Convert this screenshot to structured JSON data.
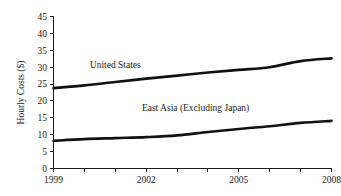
{
  "chart_data": {
    "type": "line",
    "title": "",
    "xlabel": "",
    "ylabel": "Hourly Costs ($)",
    "xlim": [
      1999,
      2008
    ],
    "ylim": [
      0,
      45
    ],
    "grid": false,
    "legend_position": "inline-annotation",
    "x": [
      1999,
      2000,
      2001,
      2002,
      2003,
      2004,
      2005,
      2006,
      2007,
      2008
    ],
    "y_ticks": [
      0,
      5,
      10,
      15,
      20,
      25,
      30,
      35,
      40,
      45
    ],
    "y_tick_labels": [
      "0",
      "5",
      "10",
      "15",
      "20",
      "25",
      "30",
      "35",
      "40",
      "45"
    ],
    "x_ticks": [
      1999,
      2000,
      2001,
      2002,
      2003,
      2004,
      2005,
      2006,
      2007,
      2008
    ],
    "x_tick_labels_shown": [
      "1999",
      "2002",
      "2005",
      "2008"
    ],
    "x_labeled_ticks": [
      1999,
      2002,
      2005,
      2008
    ],
    "series": [
      {
        "name": "United States",
        "label": "United States",
        "color": "#111111",
        "values": [
          23.8,
          24.6,
          25.6,
          26.6,
          27.5,
          28.4,
          29.2,
          30.0,
          31.8,
          32.6
        ],
        "label_x": 2001.0,
        "label_y": 29.9
      },
      {
        "name": "East Asia (Excluding Japan)",
        "label": "East Asia (Excluding Japan)",
        "color": "#111111",
        "values": [
          8.2,
          8.7,
          9.0,
          9.3,
          9.8,
          10.8,
          11.7,
          12.5,
          13.5,
          14.1
        ],
        "label_x": 2003.6,
        "label_y": 17.0
      }
    ]
  }
}
